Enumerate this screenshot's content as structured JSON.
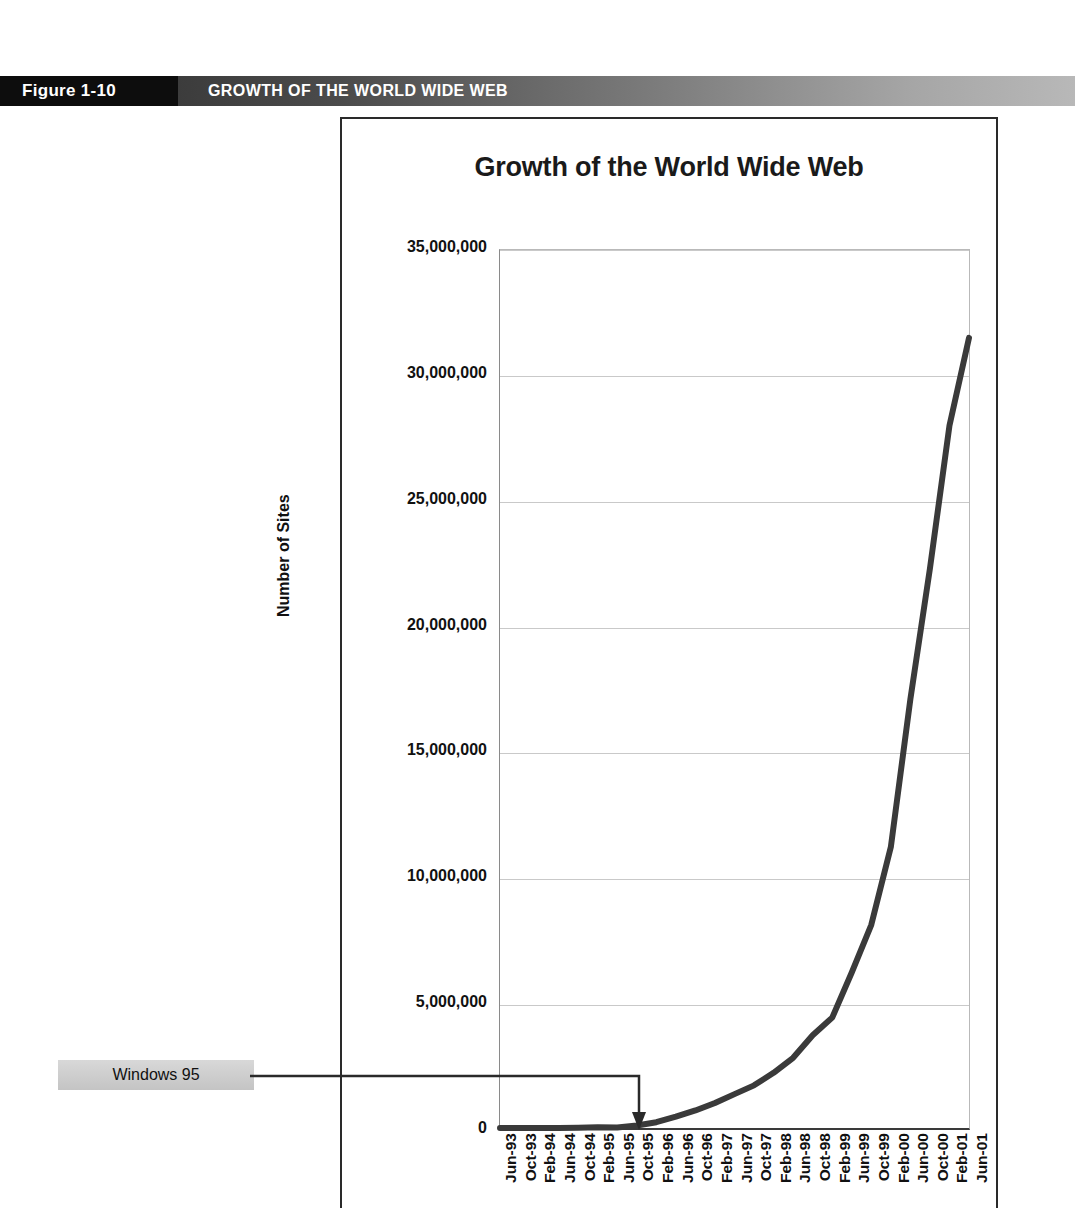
{
  "figure": {
    "number_label": "Figure 1-10",
    "caption": "GROWTH OF THE WORLD WIDE WEB"
  },
  "annotations": [
    {
      "name": "windows-95",
      "label": "Windows 95",
      "points_to_category": "Oct-95"
    }
  ],
  "colors": {
    "header_black": "#0d0d0d",
    "header_gray": "#7e7e7e",
    "line_color": "#3a3a3a",
    "gridline": "#c9c9c9",
    "callout_fill": "#cfcfcf"
  },
  "chart_data": {
    "type": "line",
    "title": "Growth of the World Wide Web",
    "xlabel": "",
    "ylabel": "Number of Sites",
    "ylim": [
      0,
      35000000
    ],
    "grid": true,
    "legend": null,
    "ytick_labels": [
      "35,000,000",
      "30,000,000",
      "25,000,000",
      "20,000,000",
      "15,000,000",
      "10,000,000",
      "5,000,000",
      "0"
    ],
    "yticks": [
      35000000,
      30000000,
      25000000,
      20000000,
      15000000,
      10000000,
      5000000,
      0
    ],
    "categories": [
      "Jun-93",
      "Oct-93",
      "Feb-94",
      "Jun-94",
      "Oct-94",
      "Feb-95",
      "Jun-95",
      "Oct-95",
      "Feb-96",
      "Jun-96",
      "Oct-96",
      "Feb-97",
      "Jun-97",
      "Oct-97",
      "Feb-98",
      "Jun-98",
      "Oct-98",
      "Feb-99",
      "Jun-99",
      "Oct-99",
      "Feb-00",
      "Jun-00",
      "Oct-00",
      "Feb-01",
      "Jun-01"
    ],
    "series": [
      {
        "name": "Number of Sites",
        "values": [
          130,
          500,
          2738,
          2738,
          10022,
          27000,
          23500,
          100000,
          230000,
          450000,
          700000,
          1000000,
          1350000,
          1700000,
          2200000,
          2800000,
          3700000,
          4400000,
          6200000,
          8100000,
          11200000,
          17100000,
          22300000,
          28000000,
          31500000
        ]
      }
    ]
  }
}
